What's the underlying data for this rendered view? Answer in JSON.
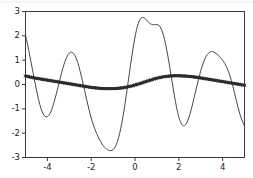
{
  "figure": {
    "background": "#ffffff",
    "axes_color": "#3a3a3a",
    "tick_label_color": "#1c1c1c"
  },
  "chart_data": {
    "type": "line",
    "title": "",
    "xlabel": "",
    "ylabel": "",
    "xlim": [
      -5.0,
      5.0
    ],
    "ylim": [
      -3.0,
      3.0
    ],
    "grid": false,
    "legend": null,
    "xticks": [
      -4,
      -2,
      0,
      2,
      4
    ],
    "xticklabels": [
      "-4",
      "-2",
      "0",
      "2",
      "4"
    ],
    "yticks": [
      -3,
      -2,
      -1,
      0,
      1,
      2,
      3
    ],
    "yticklabels": [
      "-3",
      "-2",
      "-1",
      "0",
      "1",
      "2",
      "3"
    ],
    "series": [
      {
        "name": "oscillation",
        "type": "line",
        "color": "#333333",
        "linewidth": 0.9,
        "marker": "none",
        "description": "amplitude-modulated sinusoid, envelope peaks near x=-1 and x=1",
        "x": [
          -5.0,
          -4.9,
          -4.8,
          -4.7,
          -4.6,
          -4.5,
          -4.4,
          -4.3,
          -4.2,
          -4.1,
          -4.0,
          -3.9,
          -3.8,
          -3.7,
          -3.6,
          -3.5,
          -3.4,
          -3.3,
          -3.2,
          -3.1,
          -3.0,
          -2.9,
          -2.8,
          -2.7,
          -2.6,
          -2.5,
          -2.4,
          -2.3,
          -2.2,
          -2.1,
          -2.0,
          -1.9,
          -1.8,
          -1.7,
          -1.6,
          -1.5,
          -1.4,
          -1.3,
          -1.2,
          -1.1,
          -1.0,
          -0.9,
          -0.8,
          -0.7,
          -0.6,
          -0.5,
          -0.4,
          -0.3,
          -0.2,
          -0.1,
          0.0,
          0.1,
          0.2,
          0.3,
          0.4,
          0.5,
          0.6,
          0.7,
          0.8,
          0.9,
          1.0,
          1.1,
          1.2,
          1.3,
          1.4,
          1.5,
          1.6,
          1.7,
          1.8,
          1.9,
          2.0,
          2.1,
          2.2,
          2.3,
          2.4,
          2.5,
          2.6,
          2.7,
          2.8,
          2.9,
          3.0,
          3.1,
          3.2,
          3.3,
          3.4,
          3.5,
          3.6,
          3.7,
          3.8,
          3.9,
          4.0,
          4.1,
          4.2,
          4.3,
          4.4,
          4.5,
          4.6,
          4.7,
          4.8,
          4.9,
          5.0
        ],
        "y": [
          2.02,
          1.62,
          1.17,
          0.7,
          0.23,
          -0.22,
          -0.63,
          -0.97,
          -1.2,
          -1.31,
          -1.32,
          -1.22,
          -1.02,
          -0.74,
          -0.41,
          -0.05,
          0.31,
          0.65,
          0.94,
          1.16,
          1.29,
          1.33,
          1.27,
          1.11,
          0.86,
          0.53,
          0.15,
          -0.25,
          -0.65,
          -1.03,
          -1.37,
          -1.66,
          -1.91,
          -2.12,
          -2.3,
          -2.45,
          -2.57,
          -2.65,
          -2.7,
          -2.72,
          -2.68,
          -2.56,
          -2.34,
          -2.01,
          -1.58,
          -1.05,
          -0.45,
          0.18,
          0.82,
          1.42,
          1.95,
          2.36,
          2.62,
          2.74,
          2.75,
          2.68,
          2.58,
          2.5,
          2.46,
          2.46,
          2.46,
          2.42,
          2.28,
          2.02,
          1.64,
          1.17,
          0.64,
          0.08,
          -0.46,
          -0.95,
          -1.33,
          -1.58,
          -1.69,
          -1.66,
          -1.5,
          -1.24,
          -0.91,
          -0.54,
          -0.16,
          0.21,
          0.55,
          0.84,
          1.07,
          1.23,
          1.32,
          1.35,
          1.33,
          1.28,
          1.2,
          1.11,
          1.0,
          0.86,
          0.68,
          0.45,
          0.16,
          -0.18,
          -0.56,
          -0.92,
          -1.24,
          -1.5,
          -1.7
        ]
      },
      {
        "name": "smooth-trend-markers",
        "type": "scatter",
        "color": "#2b2b2b",
        "marker": "x",
        "markersize": 3,
        "linewidth": 2.6,
        "description": "dense markers tracing a shallow low-frequency wave near zero",
        "x": [
          -5.0,
          -4.8,
          -4.6,
          -4.4,
          -4.2,
          -4.0,
          -3.8,
          -3.6,
          -3.4,
          -3.2,
          -3.0,
          -2.8,
          -2.6,
          -2.4,
          -2.2,
          -2.0,
          -1.8,
          -1.6,
          -1.4,
          -1.2,
          -1.0,
          -0.8,
          -0.6,
          -0.4,
          -0.2,
          0.0,
          0.2,
          0.4,
          0.6,
          0.8,
          1.0,
          1.2,
          1.4,
          1.6,
          1.8,
          2.0,
          2.2,
          2.4,
          2.6,
          2.8,
          3.0,
          3.2,
          3.4,
          3.6,
          3.8,
          4.0,
          4.2,
          4.4,
          4.6,
          4.8,
          5.0
        ],
        "y": [
          0.35,
          0.31,
          0.27,
          0.24,
          0.21,
          0.18,
          0.15,
          0.12,
          0.09,
          0.06,
          0.03,
          0.0,
          -0.03,
          -0.06,
          -0.09,
          -0.12,
          -0.14,
          -0.16,
          -0.17,
          -0.17,
          -0.17,
          -0.16,
          -0.14,
          -0.11,
          -0.07,
          -0.02,
          0.03,
          0.09,
          0.15,
          0.21,
          0.26,
          0.3,
          0.33,
          0.35,
          0.36,
          0.36,
          0.35,
          0.34,
          0.32,
          0.3,
          0.27,
          0.24,
          0.21,
          0.18,
          0.15,
          0.12,
          0.09,
          0.06,
          0.03,
          0.0,
          -0.03
        ]
      }
    ]
  }
}
